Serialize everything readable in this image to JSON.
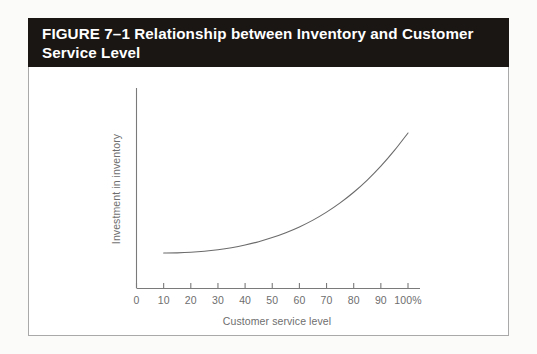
{
  "figure": {
    "caption": "FIGURE 7–1 Relationship between Inventory and Customer Service Level",
    "caption_bar_color": "#1a1613",
    "caption_text_color": "#ffffff",
    "frame_border_color": "#a9a9a9",
    "page_background": "#fbfbfa"
  },
  "chart_data": {
    "type": "line",
    "title": "",
    "subtitle": "",
    "xlabel": "Customer service level",
    "ylabel": "Investment in inventory",
    "xlim": [
      0,
      105
    ],
    "ylim": [
      0,
      100
    ],
    "grid": false,
    "legend": "none",
    "axis_color": "#7a7a7a",
    "line_color": "#6b6b6b",
    "xticks": [
      0,
      10,
      20,
      30,
      40,
      50,
      60,
      70,
      80,
      90,
      100
    ],
    "xtick_labels": [
      "0",
      "10",
      "20",
      "30",
      "40",
      "50",
      "60",
      "70",
      "80",
      "90",
      "100%"
    ],
    "yticks": [],
    "ytick_labels": [],
    "annotations": [],
    "series": [
      {
        "name": "Investment in inventory",
        "x": [
          10,
          15,
          20,
          25,
          30,
          35,
          40,
          45,
          50,
          55,
          60,
          65,
          70,
          75,
          80,
          85,
          90,
          95,
          100
        ],
        "y": [
          12.5,
          12.6,
          13.0,
          13.8,
          15.0,
          16.6,
          18.7,
          21.3,
          24.5,
          28.3,
          32.8,
          38.1,
          44.3,
          51.5,
          59.8,
          69.3,
          80.1,
          92.4,
          106.0
        ]
      }
    ]
  },
  "axis_ticks": {
    "labels": [
      "0",
      "10",
      "20",
      "30",
      "40",
      "50",
      "60",
      "70",
      "80",
      "90",
      "100%"
    ]
  }
}
